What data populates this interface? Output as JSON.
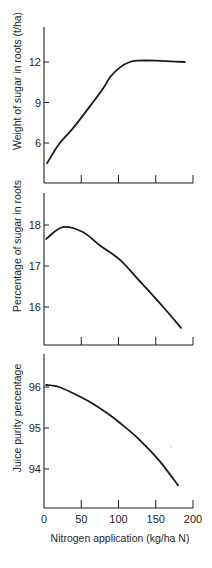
{
  "figure": {
    "x_axis_label": "Nitrogen application (kg/ha N)",
    "x_tick_labels": [
      "0",
      "50",
      "100",
      "150",
      "200"
    ]
  },
  "chart_data": [
    {
      "type": "line",
      "title": "",
      "xlabel": "",
      "ylabel": "Weight of sugar in roots (t/ha)",
      "xlim": [
        0,
        200
      ],
      "ylim": [
        3.0,
        15.5
      ],
      "x_ticks": [
        0,
        50,
        100,
        150,
        200
      ],
      "x_tick_labels_shown": false,
      "y_ticks": [
        6,
        9,
        12
      ],
      "y_tick_labels": [
        "6",
        "9",
        "12"
      ],
      "grid": false,
      "legend": null,
      "series": [
        {
          "name": "Weight of sugar in roots",
          "x": [
            4,
            20,
            39,
            60,
            80,
            89,
            102,
            115,
            125,
            150,
            170,
            189
          ],
          "y": [
            4.5,
            5.9,
            7.1,
            8.6,
            10.1,
            10.9,
            11.6,
            12.0,
            12.1,
            12.1,
            12.05,
            12.0
          ]
        }
      ]
    },
    {
      "type": "line",
      "title": "",
      "xlabel": "",
      "ylabel": "Percentage of sugar in roots",
      "xlim": [
        0,
        200
      ],
      "ylim": [
        15.05,
        18.8
      ],
      "x_ticks": [
        0,
        50,
        100,
        150,
        200
      ],
      "x_tick_labels_shown": false,
      "y_ticks": [
        16,
        17,
        18
      ],
      "y_tick_labels": [
        "16",
        "17",
        "18"
      ],
      "grid": false,
      "legend": null,
      "series": [
        {
          "name": "Percentage of sugar in roots",
          "x": [
            3,
            25,
            52,
            75,
            102,
            130,
            160,
            184
          ],
          "y": [
            17.66,
            17.95,
            17.83,
            17.5,
            17.15,
            16.6,
            16.0,
            15.49
          ]
        }
      ]
    },
    {
      "type": "line",
      "title": "",
      "xlabel": "Nitrogen application (kg/ha N)",
      "ylabel": "Juice purity percentage",
      "xlim": [
        0,
        200
      ],
      "ylim": [
        93.05,
        96.8
      ],
      "x_ticks": [
        0,
        50,
        100,
        150,
        200
      ],
      "x_tick_labels": [
        "0",
        "50",
        "100",
        "150",
        "200"
      ],
      "y_ticks": [
        94,
        95,
        96
      ],
      "y_tick_labels": [
        "94",
        "95",
        "96"
      ],
      "grid": false,
      "legend": null,
      "series": [
        {
          "name": "Juice purity percentage",
          "x": [
            3,
            20,
            39,
            60,
            84,
            105,
            129,
            155,
            180
          ],
          "y": [
            96.05,
            96.0,
            95.85,
            95.65,
            95.37,
            95.08,
            94.7,
            94.2,
            93.6
          ]
        }
      ]
    }
  ]
}
